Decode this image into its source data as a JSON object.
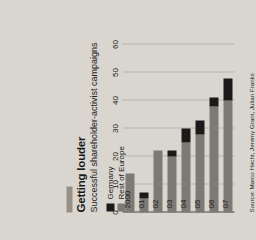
{
  "figure": {
    "title": "Getting louder",
    "subtitle": "Successful shareholder-activist campaigns",
    "source": "Source: Marco Hecht, Jeremy Grant, Julian Franks",
    "accent_color": "#9a8f86",
    "background_color": "#d9d6cf"
  },
  "legend": {
    "position": "top-left",
    "items": [
      {
        "label": "Germany",
        "color": "#1c1a18",
        "swatch": "legend-swatch-germany"
      },
      {
        "label": "Rest of Europe",
        "color": "#7d7a75",
        "swatch": "legend-swatch-rest-of-europe"
      }
    ]
  },
  "chart_data": {
    "type": "bar",
    "orientation": "horizontal",
    "stacked": true,
    "title": "Getting louder",
    "subtitle": "Successful shareholder-activist campaigns",
    "xlabel": "",
    "ylabel": "",
    "xlim": [
      0,
      60
    ],
    "xticks": [
      0,
      10,
      20,
      30,
      40,
      50,
      60
    ],
    "xtick_labels": [
      "0",
      "10",
      "20",
      "30",
      "40",
      "50",
      "60"
    ],
    "grid": true,
    "legend_position": "top-left",
    "categories": [
      "2000",
      "01",
      "02",
      "03",
      "04",
      "05",
      "06",
      "07"
    ],
    "series": [
      {
        "name": "Rest of Europe",
        "color": "#7d7a75",
        "values": [
          14,
          5,
          22,
          20,
          25,
          28,
          38,
          40
        ]
      },
      {
        "name": "Germany",
        "color": "#1c1a18",
        "values": [
          0,
          2,
          0,
          2,
          5,
          5,
          3,
          8
        ]
      }
    ],
    "totals": [
      14,
      7,
      22,
      22,
      30,
      33,
      41,
      48
    ]
  }
}
